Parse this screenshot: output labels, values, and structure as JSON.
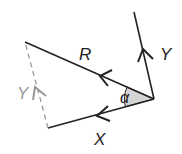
{
  "diagram": {
    "type": "vector-resolution",
    "vectors": [
      {
        "label": "R",
        "from": [
          154,
          99
        ],
        "to": [
          25,
          42
        ],
        "style": "solid"
      },
      {
        "label": "Y",
        "from": [
          154,
          99
        ],
        "to": [
          134,
          12
        ],
        "style": "solid"
      },
      {
        "label": "X",
        "from": [
          154,
          99
        ],
        "to": [
          48,
          128
        ],
        "style": "solid"
      },
      {
        "label": "Y",
        "from": [
          48,
          128
        ],
        "to": [
          25,
          42
        ],
        "style": "dashed"
      }
    ],
    "angle": {
      "label": "α",
      "between": [
        "R",
        "X"
      ],
      "fill": "#d4d4d4"
    },
    "labels": {
      "r": "R",
      "y": "Y",
      "x": "X",
      "y_dashed": "Y",
      "alpha": "α"
    },
    "colors": {
      "line": "#222222",
      "dashed": "#999999",
      "angle_fill": "#d4d4d4"
    }
  }
}
